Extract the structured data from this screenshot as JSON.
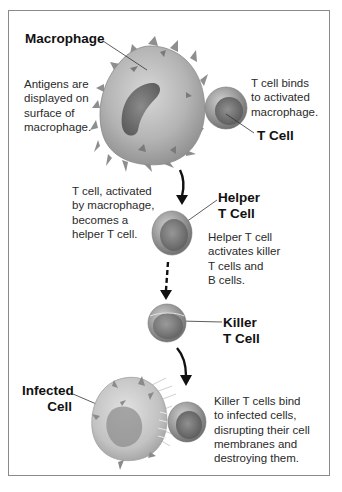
{
  "diagram": {
    "labels": {
      "macrophage": "Macrophage",
      "t_cell": "T Cell",
      "helper_t_cell": "Helper\nT Cell",
      "killer_t_cell": "Killer\nT Cell",
      "infected_cell": "Infected\nCell"
    },
    "captions": {
      "antigens": "Antigens are\ndisplayed on\nsurface of\nmacrophage.",
      "t_cell_binds": "T cell binds\nto activated\nmacrophage.",
      "t_cell_activated": "T cell, activated\nby macrophage,\nbecomes a\nhelper T cell.",
      "helper_activates": "Helper T cell\nactivates killer\nT cells and\nB cells.",
      "killer_binds": "Killer T cells bind\nto infected cells,\ndisrupting their cell\nmembranes and\ndestroying them."
    },
    "arrows": [
      {
        "from": "macrophage",
        "to": "helper_t_cell",
        "style": "solid"
      },
      {
        "from": "helper_t_cell",
        "to": "killer_t_cell",
        "style": "dashed"
      },
      {
        "from": "killer_t_cell",
        "to": "infected_cell",
        "style": "solid"
      }
    ],
    "colors": {
      "frame_border": "#8a8a8a",
      "cell_gray": "#a8a8a8",
      "nucleus": "#6e6e6e",
      "arrow": "#111111",
      "text": "#2a2a2a"
    }
  }
}
